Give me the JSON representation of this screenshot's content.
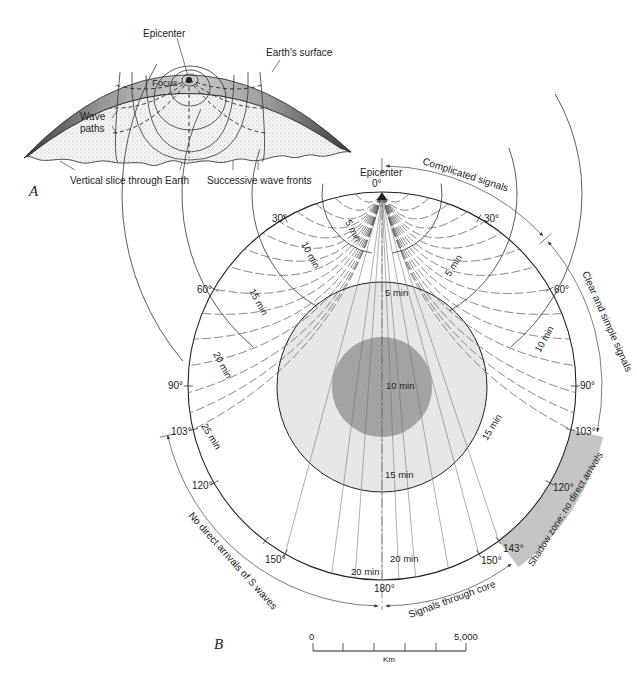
{
  "panel_a": {
    "label": "A",
    "callouts": {
      "epicenter": "Epicenter",
      "earth_surface": "Earth's surface",
      "focus": "Focus",
      "wave_paths_1": "Wave",
      "wave_paths_2": "paths",
      "vertical_slice": "Vertical slice through Earth",
      "wave_fronts": "Successive wave fronts"
    }
  },
  "panel_b": {
    "label": "B",
    "epicenter_label": "Epicenter",
    "degree_labels": {
      "d0": "0°",
      "d30_left": "30°",
      "d30_right": "30°",
      "d60_left": "60°",
      "d60_right": "60°",
      "d90_left": "90°",
      "d90_right": "90°",
      "d103_left": "103°",
      "d103_right": "103°",
      "d120_left": "120°",
      "d120_right": "120°",
      "d143": "143°",
      "d150_left": "150°",
      "d150_right": "150°",
      "d180": "180°"
    },
    "time_labels": {
      "mantle_left_5": "5 min",
      "mantle_left_10": "10 min",
      "mantle_left_15": "15 min",
      "mantle_left_20": "20 min",
      "mantle_left_25": "25 min",
      "mantle_right_5": "5 min",
      "mantle_right_10": "10 min",
      "core_5": "5 min",
      "core_10": "10 min",
      "core_15": "15 min",
      "core_right_15": "15 min",
      "bottom_20a": "20 min",
      "bottom_20b": "20 min"
    },
    "arc_annotations": {
      "complicated": "Complicated signals",
      "clear_simple": "Clear and simple signals",
      "shadow_zone": "Shadow zone; no direct arrivals",
      "through_core": "Signals through core",
      "no_s_waves": "No direct arrivals of S waves"
    },
    "scale_bar": {
      "min_label": "0",
      "max_label": "5,000",
      "unit": "Km"
    },
    "colors": {
      "outer_core": "#e6e6e6",
      "inner_core": "#a3a3a3",
      "shadow_zone": "#c4c4c4",
      "crust_shading": "#8a8a8a"
    },
    "geometry": {
      "cx": 382,
      "cy": 386,
      "earth_r": 194,
      "outer_core_r": 105,
      "inner_core_r": 50,
      "shadow_zone_deg": [
        103,
        143
      ]
    }
  }
}
